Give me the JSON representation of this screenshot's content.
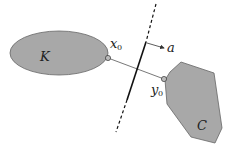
{
  "diagram": {
    "title": "",
    "colors": {
      "fill": "#a8a8a8",
      "stroke": "#555555",
      "line": "#111111",
      "background": "#ffffff"
    },
    "shapes": {
      "K": {
        "label": "K",
        "type": "ellipse",
        "cx": 59,
        "cy": 53,
        "rx": 49,
        "ry": 22
      },
      "C": {
        "label": "C",
        "type": "polygon",
        "points": "170,72 181,62 214,73 222,128 215,143 191,137 167,104 165,80"
      }
    },
    "points": {
      "x0": {
        "label": "x",
        "sub": "0",
        "x": 108,
        "y": 58
      },
      "y0": {
        "label": "y",
        "sub": "0",
        "x": 164,
        "y": 79
      }
    },
    "separating_line": {
      "dashed_top": [
        156,
        4,
        146,
        42
      ],
      "solid": [
        146,
        42,
        127,
        100
      ],
      "dashed_bottom": [
        127,
        100,
        116,
        132
      ]
    },
    "normal_vector": {
      "label": "a",
      "from": [
        147,
        43
      ],
      "to": [
        165,
        48
      ]
    }
  }
}
